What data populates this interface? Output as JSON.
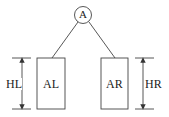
{
  "diagram": {
    "type": "binary-tree-height",
    "root": {
      "label": "A"
    },
    "left_subtree": {
      "label": "AL",
      "height_label": "HL"
    },
    "right_subtree": {
      "label": "AR",
      "height_label": "HR"
    },
    "colors": {
      "stroke": "#444444",
      "text": "#222222",
      "background": "#ffffff"
    }
  }
}
